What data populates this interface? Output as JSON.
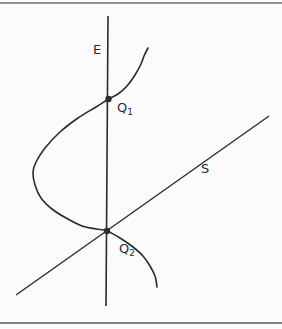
{
  "figure": {
    "colors": {
      "background": "#fbfbfb",
      "ink": "#2b2b2b",
      "top_rule": "#8f8f8f",
      "bottom_rule": "#7f7f7f"
    },
    "labels": {
      "vertical_axis": "E",
      "diagonal_line": "S",
      "point1": {
        "base": "Q",
        "sub": "1"
      },
      "point2": {
        "base": "Q",
        "sub": "2"
      }
    },
    "geometry": {
      "canvas": {
        "width": 282,
        "height": 329
      },
      "top_rule": {
        "x1": 0,
        "y1": 3,
        "x2": 282,
        "y2": 3
      },
      "bottom_rule": {
        "x1": 0,
        "y1": 323,
        "x2": 282,
        "y2": 323
      },
      "vertical_axis": {
        "x1": 108,
        "y1": 16,
        "x2": 106,
        "y2": 306
      },
      "diagonal": {
        "x1": 16,
        "y1": 295,
        "x2": 269,
        "y2": 116
      },
      "curve_points": [
        [
          148,
          48
        ],
        [
          144,
          56
        ],
        [
          141,
          64
        ],
        [
          135,
          75
        ],
        [
          127,
          86
        ],
        [
          118,
          94
        ],
        [
          108.5,
          99
        ],
        [
          96,
          107
        ],
        [
          78,
          118
        ],
        [
          60,
          132
        ],
        [
          45,
          148
        ],
        [
          36,
          162
        ],
        [
          33,
          172
        ],
        [
          35,
          185
        ],
        [
          41,
          198
        ],
        [
          52,
          209
        ],
        [
          66,
          218
        ],
        [
          82,
          226
        ],
        [
          96,
          229
        ],
        [
          107,
          231
        ],
        [
          120,
          238
        ],
        [
          133,
          247
        ],
        [
          143,
          256
        ],
        [
          150,
          266
        ],
        [
          155,
          276
        ],
        [
          157,
          287
        ]
      ],
      "dots": [
        {
          "cx": 108.5,
          "cy": 99,
          "r": 3.2
        },
        {
          "cx": 107,
          "cy": 231,
          "r": 3.2
        }
      ],
      "label_positions": {
        "e": {
          "x": 93,
          "y": 54
        },
        "s": {
          "x": 201,
          "y": 173
        },
        "q1": {
          "x": 117,
          "y": 112
        },
        "q2": {
          "x": 119,
          "y": 253
        }
      },
      "stroke_widths": {
        "rule": 2.2,
        "axis": 1.6,
        "diagonal": 1.4,
        "curve": 1.6
      }
    }
  }
}
